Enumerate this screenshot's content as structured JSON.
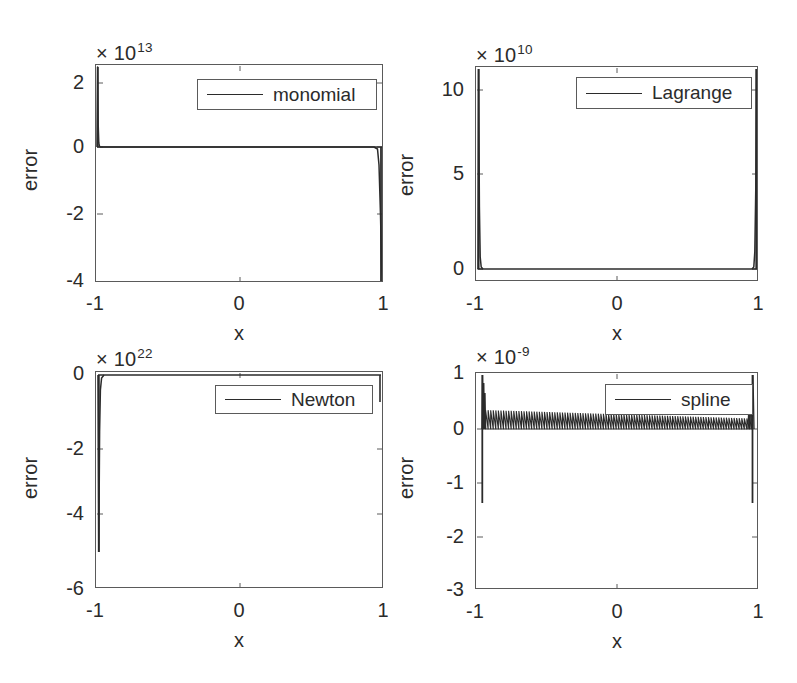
{
  "figure": {
    "width": 797,
    "height": 683,
    "background": "#ffffff",
    "axis_color": "#5a5a5a",
    "line_color": "#2b2b2b"
  },
  "chart_data": [
    {
      "id": "monomial",
      "type": "line",
      "title": "",
      "legend_label": "monomial",
      "legend_position": "north-east-inside",
      "xlabel": "x",
      "ylabel": "error",
      "xlim": [
        -1,
        1
      ],
      "ylim": [
        -4,
        2.4
      ],
      "xticks": [
        -1,
        0,
        1
      ],
      "xticklabels": [
        "-1",
        "0",
        "1"
      ],
      "yticks": [
        2,
        0,
        -2,
        -4
      ],
      "yticklabels": [
        "2",
        "0",
        "-2",
        "-4"
      ],
      "y_exponent_prefix": "× 10",
      "y_exponent": "13",
      "y_scale": 10000000000000.0,
      "grid": false,
      "description": "Interpolation error for monomial basis: near-zero across interior with large positive spike at x=-1 reaching 2.4e13 and negative spike at x=+1 reaching about -4e13.",
      "x": [
        -1.0,
        -0.995,
        -0.99,
        -0.98,
        -0.95,
        -0.9,
        -0.5,
        0.0,
        0.5,
        0.9,
        0.95,
        0.98,
        0.99,
        0.995,
        1.0
      ],
      "values": [
        0,
        24000000000000.0,
        1000000000000.0,
        200000000000.0,
        0,
        0,
        0,
        0,
        0,
        0,
        0,
        -500000000000.0,
        -10000000000000.0,
        -32000000000000.0,
        -40000000000000.0
      ]
    },
    {
      "id": "lagrange",
      "type": "line",
      "title": "",
      "legend_label": "Lagrange",
      "legend_position": "north-east-inside",
      "xlabel": "x",
      "ylabel": "error",
      "xlim": [
        -1,
        1
      ],
      "ylim": [
        -0.4,
        11.4
      ],
      "xticks": [
        -1,
        0,
        1
      ],
      "xticklabels": [
        "-1",
        "0",
        "1"
      ],
      "yticks": [
        10,
        5,
        0
      ],
      "yticklabels": [
        "10",
        "5",
        "0"
      ],
      "y_exponent_prefix": "× 10",
      "y_exponent": "10",
      "y_scale": 10000000000.0,
      "grid": false,
      "description": "Interpolation error for Lagrange basis: essentially zero across interior with tall positive spikes at both endpoints reaching about 11e10.",
      "x": [
        -1.0,
        -0.997,
        -0.99,
        -0.98,
        -0.95,
        -0.5,
        0.0,
        0.5,
        0.95,
        0.98,
        0.99,
        0.997,
        1.0
      ],
      "values": [
        0,
        113000000000.0,
        10000000000.0,
        1000000000.0,
        0,
        0,
        0,
        0,
        0,
        1000000000.0,
        10000000000.0,
        113000000000.0,
        0
      ]
    },
    {
      "id": "newton",
      "type": "line",
      "title": "",
      "legend_label": "Newton",
      "legend_position": "north-east-inside",
      "xlabel": "x",
      "ylabel": "error",
      "xlim": [
        -1,
        1
      ],
      "ylim": [
        -6,
        0.35
      ],
      "xticks": [
        -1,
        0,
        1
      ],
      "xticklabels": [
        "-1",
        "0",
        "1"
      ],
      "yticks": [
        0,
        -2,
        -4,
        -6
      ],
      "yticklabels": [
        "0",
        "-2",
        "-4",
        "-6"
      ],
      "y_exponent_prefix": "× 10",
      "y_exponent": "22",
      "y_scale": 1e+22,
      "grid": false,
      "description": "Interpolation error for Newton basis: flat near zero across the interior with a deep negative spike at x=-1 descending to about -5.1e22.",
      "x": [
        -1.0,
        -0.997,
        -0.99,
        -0.98,
        -0.95,
        -0.5,
        0.0,
        0.5,
        0.95,
        0.99,
        0.997,
        1.0
      ],
      "values": [
        0,
        -5.1e+22,
        -6e+21,
        -5e+20,
        0,
        0,
        0,
        0,
        0,
        -5e+20,
        -6e+21,
        0
      ]
    },
    {
      "id": "spline",
      "type": "line",
      "title": "",
      "legend_label": "spline",
      "legend_position": "north-east-inside",
      "xlabel": "x",
      "ylabel": "error",
      "xlim": [
        -1,
        1
      ],
      "ylim": [
        -3,
        1.05
      ],
      "xticks": [
        -1,
        0,
        1
      ],
      "xticklabels": [
        "-1",
        "0",
        "1"
      ],
      "yticks": [
        1,
        0,
        -1,
        -2,
        -3
      ],
      "yticklabels": [
        "1",
        "0",
        "-1",
        "-2",
        "-3"
      ],
      "y_exponent_prefix": "× 10",
      "y_exponent": "-9",
      "y_scale": 1e-09,
      "grid": false,
      "description": "Interpolation error for cubic spline: dense high-frequency oscillation band between 0 and about 0.35e-9 across the interior, with spikes at both ends rising to 1e-9 and dropping to about -2.3e-9.",
      "oscillation": {
        "cycles": 105,
        "interior_band_low": 0.0,
        "interior_band_high_left": 3.6e-10,
        "interior_band_high_right": 2e-10,
        "edge_spike_up": 1e-09,
        "edge_spike_down": -2.3e-09
      }
    }
  ],
  "subplots": [
    {
      "key": "monomial",
      "legend_label": "monomial",
      "exp_prefix": "× 10",
      "exp_sup": "13",
      "ylabel": "error",
      "xlabel": "x",
      "yticklabels": [
        "2",
        "0",
        "-2",
        "-4"
      ],
      "xticklabels": [
        "-1",
        "0",
        "1"
      ]
    },
    {
      "key": "lagrange",
      "legend_label": "Lagrange",
      "exp_prefix": "× 10",
      "exp_sup": "10",
      "ylabel": "error",
      "xlabel": "x",
      "yticklabels": [
        "10",
        "5",
        "0"
      ],
      "xticklabels": [
        "-1",
        "0",
        "1"
      ]
    },
    {
      "key": "newton",
      "legend_label": "Newton",
      "exp_prefix": "× 10",
      "exp_sup": "22",
      "ylabel": "error",
      "xlabel": "x",
      "yticklabels": [
        "0",
        "-2",
        "-4",
        "-6"
      ],
      "xticklabels": [
        "-1",
        "0",
        "1"
      ]
    },
    {
      "key": "spline",
      "legend_label": "spline",
      "exp_prefix": "× 10",
      "exp_sup": "-9",
      "ylabel": "error",
      "xlabel": "x",
      "yticklabels": [
        "1",
        "0",
        "-1",
        "-2",
        "-3"
      ],
      "xticklabels": [
        "-1",
        "0",
        "1"
      ]
    }
  ]
}
